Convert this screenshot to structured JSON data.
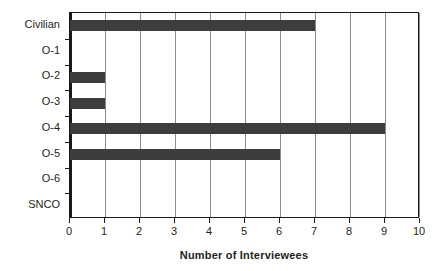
{
  "chart_data": {
    "type": "bar",
    "orientation": "horizontal",
    "title": "",
    "xlabel": "Number of Interviewees",
    "ylabel": "Rank",
    "categories": [
      "Civilian",
      "O-1",
      "O-2",
      "O-3",
      "O-4",
      "O-5",
      "O-6",
      "SNCO"
    ],
    "values": [
      7,
      0,
      1,
      1,
      9,
      6,
      0,
      0
    ],
    "xlim": [
      0,
      10
    ],
    "xticks": [
      0,
      1,
      2,
      3,
      4,
      5,
      6,
      7,
      8,
      9,
      10
    ],
    "xticklabels": [
      "0",
      "1",
      "2",
      "3",
      "4",
      "5",
      "6",
      "7",
      "8",
      "9",
      "10"
    ],
    "grid": "vertical",
    "legend": "none",
    "bar_color": "#3d3d3d",
    "background_color": "#ffffff",
    "gridline_color": "#8c8c8c",
    "axis_color": "#1a1a1a"
  }
}
